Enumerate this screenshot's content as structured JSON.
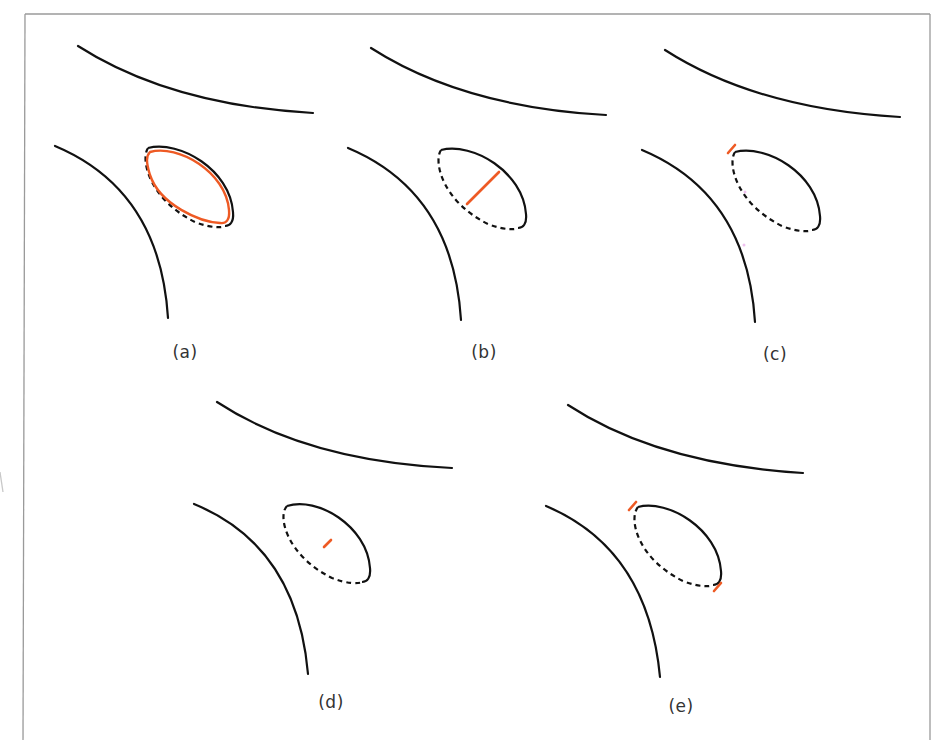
{
  "figure": {
    "frame": {
      "left": 25,
      "top": 14,
      "right": 930,
      "color": "#9a9a9a"
    },
    "colors": {
      "curve": "#111111",
      "highlight": "#ee5a24"
    },
    "panels": [
      {
        "id": "a",
        "label": "(a)",
        "label_pos": [
          185,
          352
        ],
        "offset": [
          0,
          0
        ],
        "highlight": "full-ellipse-outline"
      },
      {
        "id": "b",
        "label": "(b)",
        "label_pos": [
          484,
          352
        ],
        "offset": [
          293,
          2
        ],
        "highlight": "diagonal-segment-inside-ellipse"
      },
      {
        "id": "c",
        "label": "(c)",
        "label_pos": [
          775,
          354
        ],
        "offset": [
          587,
          4
        ],
        "highlight": "tick-at-upper-left-end"
      },
      {
        "id": "d",
        "label": "(d)",
        "label_pos": [
          331,
          702
        ],
        "offset": [
          137,
          356
        ],
        "highlight": "short-segment-at-center"
      },
      {
        "id": "e",
        "label": "(e)",
        "label_pos": [
          681,
          706
        ],
        "offset": [
          488,
          359
        ],
        "highlight": "ticks-at-both-ends"
      }
    ]
  }
}
